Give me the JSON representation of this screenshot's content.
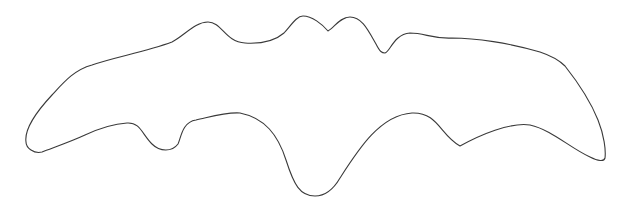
{
  "figure": {
    "stroke_color": "#3a3a3a",
    "background": "#ffffff"
  }
}
